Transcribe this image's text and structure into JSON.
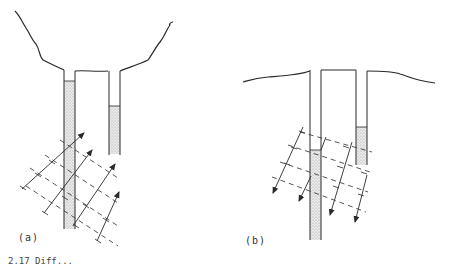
{
  "figure": {
    "panels": [
      {
        "id": "a",
        "label": "(a)",
        "surface": "concave",
        "tubes": [
          {
            "name": "left-tube",
            "fill": "partial-high"
          },
          {
            "name": "right-tube",
            "fill": "partial-low"
          }
        ],
        "wave_direction": "up-right",
        "arrow_count": 5
      },
      {
        "id": "b",
        "label": "(b)",
        "surface": "flat",
        "tubes": [
          {
            "name": "left-tube",
            "fill": "partial-low"
          },
          {
            "name": "right-tube",
            "fill": "partial-high"
          }
        ],
        "wave_direction": "down-left",
        "arrow_count": 4
      }
    ],
    "caption": "2.17 Diff..."
  },
  "colors": {
    "ink": "#2a2a2a",
    "stipple": "#c8c8c8",
    "background": "#ffffff"
  }
}
